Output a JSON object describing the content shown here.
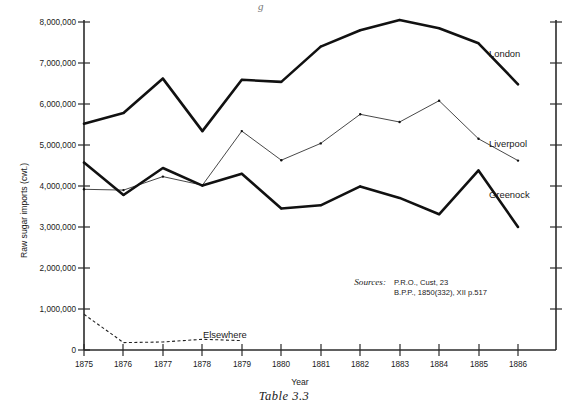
{
  "figure": {
    "caption": "Table 3.3",
    "top_fragment": "g"
  },
  "axes": {
    "y_axis_title": "Raw sugar imports (cwt.)",
    "x_axis_title": "Year",
    "y_ticks": [
      "0",
      "1,000,000",
      "2,000,000",
      "3,000,000",
      "4,000,000",
      "5,000,000",
      "6,000,000",
      "7,000,000",
      "8,000,000"
    ],
    "x_ticks": [
      "1875",
      "1876",
      "1877",
      "1878",
      "1879",
      "1880",
      "1881",
      "1882",
      "1883",
      "1884",
      "1885",
      "1886"
    ]
  },
  "series_labels": {
    "london": "London",
    "liverpool": "Liverpool",
    "greenock": "Greenock",
    "elsewhere": "Elsewhere"
  },
  "sources": {
    "heading": "Sources:",
    "line1": "P.R.O., Cust, 23",
    "line2": "B.P.P., 1850(332), XII p.517"
  },
  "colors": {
    "ink": "#111111",
    "axis": "#2b2b2b",
    "thin_line": "#333333",
    "background": "#ffffff"
  },
  "chart_data": {
    "type": "line",
    "title": "Table 3.3",
    "xlabel": "Year",
    "ylabel": "Raw sugar imports (cwt.)",
    "x": [
      1875,
      1876,
      1877,
      1878,
      1879,
      1880,
      1881,
      1882,
      1883,
      1884,
      1885,
      1886
    ],
    "xlim": [
      1875,
      1886
    ],
    "ylim": [
      0,
      8000000
    ],
    "ytick_step": 1000000,
    "grid": false,
    "legend_position": "inline-right-of-series",
    "annotations": [
      "Sources: P.R.O., Cust, 23",
      "B.P.P., 1850(332), XII p.517"
    ],
    "series": [
      {
        "name": "London",
        "style": "solid-thick",
        "values": [
          5520000,
          5780000,
          6620000,
          5340000,
          6590000,
          6540000,
          7400000,
          7800000,
          8050000,
          7850000,
          7480000,
          6480000
        ]
      },
      {
        "name": "Liverpool",
        "style": "solid-thin",
        "values": [
          3920000,
          3900000,
          4230000,
          4020000,
          5340000,
          4630000,
          5040000,
          5750000,
          5560000,
          6080000,
          5150000,
          4620000
        ]
      },
      {
        "name": "Greenock",
        "style": "solid-thick",
        "values": [
          4570000,
          3780000,
          4440000,
          4010000,
          4300000,
          3450000,
          3530000,
          3990000,
          3710000,
          3310000,
          4380000,
          3000000
        ]
      },
      {
        "name": "Elsewhere",
        "style": "dotted",
        "values": [
          870000,
          180000,
          195000,
          260000,
          230000,
          null,
          null,
          null,
          null,
          null,
          null,
          null
        ]
      }
    ]
  }
}
